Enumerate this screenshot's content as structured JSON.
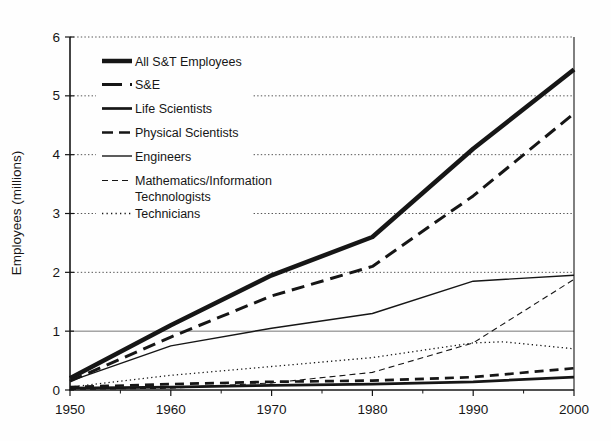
{
  "figure": {
    "background": "#fefefe",
    "ink": "#161616",
    "grid_color": "#555555",
    "solid_grid_color": "#777777"
  },
  "chart_data": {
    "type": "line",
    "title": "",
    "xlabel": "",
    "ylabel": "Employees (millions)",
    "xlim": [
      1950,
      2000
    ],
    "ylim": [
      0,
      6
    ],
    "xticks": [
      1950,
      1960,
      1970,
      1980,
      1990,
      2000
    ],
    "x_minor_ticks": [
      1955,
      1965,
      1975,
      1985,
      1995
    ],
    "yticks": [
      0,
      1,
      2,
      3,
      4,
      5,
      6
    ],
    "grid": {
      "horizontal_dotted_at": [
        2,
        3,
        4,
        5,
        6
      ],
      "horizontal_solid_at": [
        1
      ]
    },
    "legend_position": "upper-left-inside",
    "series": [
      {
        "name": "All S&T Employees",
        "x": [
          1950,
          1960,
          1970,
          1980,
          1990,
          2000
        ],
        "values": [
          0.2,
          1.1,
          1.95,
          2.6,
          4.1,
          5.45
        ],
        "line": {
          "width": 4.5,
          "dash": "solid",
          "legend_dash": "solid"
        }
      },
      {
        "name": "S&E",
        "x": [
          1950,
          1960,
          1970,
          1980,
          1990,
          2000
        ],
        "values": [
          0.15,
          0.9,
          1.6,
          2.1,
          3.3,
          4.7
        ],
        "line": {
          "width": 3,
          "dash": "13,7",
          "legend_dash": "20,8"
        }
      },
      {
        "name": "Life Scientists",
        "x": [
          1950,
          1960,
          1970,
          1980,
          1990,
          2000
        ],
        "values": [
          0.03,
          0.05,
          0.08,
          0.1,
          0.14,
          0.22
        ],
        "line": {
          "width": 2.7,
          "dash": "solid",
          "legend_dash": "solid"
        }
      },
      {
        "name": "Physical Scientists",
        "x": [
          1950,
          1960,
          1970,
          1980,
          1990,
          2000
        ],
        "values": [
          0.05,
          0.1,
          0.14,
          0.16,
          0.22,
          0.37
        ],
        "line": {
          "width": 2.7,
          "dash": "9,6",
          "legend_dash": "11,6"
        }
      },
      {
        "name": "Engineers",
        "x": [
          1950,
          1960,
          1970,
          1980,
          1990,
          2000
        ],
        "values": [
          0.15,
          0.75,
          1.05,
          1.3,
          1.85,
          1.95
        ],
        "line": {
          "width": 1.4,
          "dash": "solid",
          "legend_dash": "solid"
        }
      },
      {
        "name": "Mathematics/Information Technologists",
        "label_lines": [
          "Mathematics/Information",
          "Technologists"
        ],
        "x": [
          1950,
          1960,
          1970,
          1980,
          1990,
          2000
        ],
        "values": [
          0.01,
          0.03,
          0.12,
          0.3,
          0.8,
          1.88
        ],
        "line": {
          "width": 1.1,
          "dash": "6,4",
          "legend_dash": "6,4"
        }
      },
      {
        "name": "Technicians",
        "x": [
          1950,
          1960,
          1970,
          1980,
          1990,
          1993,
          2000
        ],
        "values": [
          0.05,
          0.25,
          0.4,
          0.55,
          0.8,
          0.82,
          0.7
        ],
        "line": {
          "width": 1.3,
          "dash": "1.3,3",
          "legend_dash": "1.3,3.2"
        }
      }
    ]
  }
}
